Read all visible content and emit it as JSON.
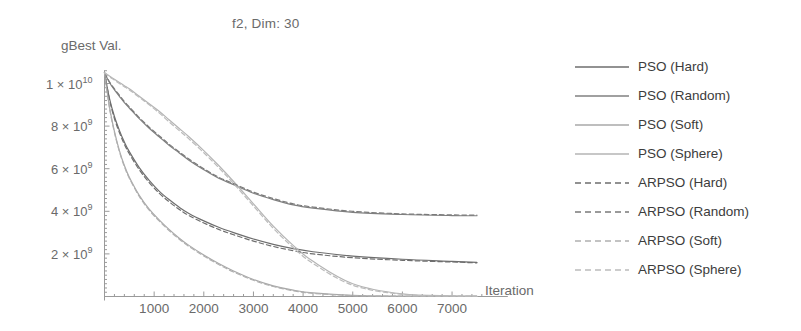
{
  "chart_data": {
    "type": "line",
    "title": "f2, Dim: 30",
    "xlabel": "Iteration",
    "ylabel": "gBest Val.",
    "xlim": [
      0,
      7600
    ],
    "ylim": [
      0,
      11000000000
    ],
    "grid": false,
    "legend_position": "right",
    "x_ticks": [
      {
        "value": 1000,
        "label": "1000"
      },
      {
        "value": 2000,
        "label": "2000"
      },
      {
        "value": 3000,
        "label": "3000"
      },
      {
        "value": 4000,
        "label": "4000"
      },
      {
        "value": 5000,
        "label": "5000"
      },
      {
        "value": 6000,
        "label": "6000"
      },
      {
        "value": 7000,
        "label": "7000"
      }
    ],
    "y_ticks": [
      {
        "value": 10000000000,
        "mantissa": "1",
        "exponent": "10",
        "label": "1 × 10^10"
      },
      {
        "value": 8000000000,
        "mantissa": "8",
        "exponent": "9",
        "label": "8 × 10^9"
      },
      {
        "value": 6000000000,
        "mantissa": "6",
        "exponent": "9",
        "label": "6 × 10^9"
      },
      {
        "value": 4000000000,
        "mantissa": "4",
        "exponent": "9",
        "label": "4 × 10^9"
      },
      {
        "value": 2000000000,
        "mantissa": "2",
        "exponent": "9",
        "label": "2 × 10^9"
      }
    ],
    "x": [
      0,
      100,
      200,
      300,
      400,
      500,
      700,
      900,
      1100,
      1300,
      1500,
      1700,
      2000,
      2300,
      2600,
      3000,
      3400,
      3800,
      4200,
      5000,
      6000,
      7000,
      7500
    ],
    "series": [
      {
        "name": "PSO (Hard)",
        "style": "solid",
        "color": "#6e6e6e",
        "values": [
          10500000000,
          9300000000,
          8450000000,
          7800000000,
          7250000000,
          6800000000,
          6050000000,
          5450000000,
          4950000000,
          4550000000,
          4200000000,
          3900000000,
          3550000000,
          3250000000,
          3000000000,
          2700000000,
          2450000000,
          2250000000,
          2100000000,
          1900000000,
          1750000000,
          1650000000,
          1600000000
        ]
      },
      {
        "name": "PSO (Random)",
        "style": "solid",
        "color": "#808080",
        "values": [
          10500000000,
          10050000000,
          9700000000,
          9400000000,
          9100000000,
          8850000000,
          8350000000,
          7900000000,
          7500000000,
          7100000000,
          6750000000,
          6400000000,
          5950000000,
          5550000000,
          5250000000,
          4850000000,
          4550000000,
          4300000000,
          4150000000,
          3950000000,
          3850000000,
          3800000000,
          3790000000
        ]
      },
      {
        "name": "PSO (Soft)",
        "style": "solid",
        "color": "#a8a8a8",
        "values": [
          10500000000,
          8900000000,
          7750000000,
          6850000000,
          6150000000,
          5600000000,
          4750000000,
          4100000000,
          3600000000,
          3150000000,
          2750000000,
          2400000000,
          1950000000,
          1550000000,
          1200000000,
          800000000,
          500000000,
          300000000,
          170000000,
          50000000,
          15000000,
          6000000,
          4000000
        ]
      },
      {
        "name": "PSO (Sphere)",
        "style": "solid",
        "color": "#b4b4b4",
        "values": [
          10500000000,
          10350000000,
          10200000000,
          10050000000,
          9900000000,
          9750000000,
          9400000000,
          9050000000,
          8700000000,
          8300000000,
          7900000000,
          7500000000,
          6850000000,
          6150000000,
          5400000000,
          4350000000,
          3300000000,
          2400000000,
          1650000000,
          600000000,
          120000000,
          30000000,
          15000000
        ]
      },
      {
        "name": "ARPSO (Hard)",
        "style": "dashed",
        "color": "#6e6e6e",
        "values": [
          10500000000,
          9250000000,
          8350000000,
          7700000000,
          7150000000,
          6700000000,
          5950000000,
          5350000000,
          4850000000,
          4450000000,
          4100000000,
          3800000000,
          3450000000,
          3150000000,
          2900000000,
          2600000000,
          2350000000,
          2150000000,
          2000000000,
          1820000000,
          1700000000,
          1620000000,
          1580000000
        ]
      },
      {
        "name": "ARPSO (Random)",
        "style": "dashed",
        "color": "#7a7a7a",
        "values": [
          10500000000,
          10080000000,
          9750000000,
          9450000000,
          9150000000,
          8900000000,
          8400000000,
          7950000000,
          7550000000,
          7150000000,
          6800000000,
          6450000000,
          6000000000,
          5600000000,
          5300000000,
          4900000000,
          4600000000,
          4350000000,
          4200000000,
          4000000000,
          3880000000,
          3830000000,
          3820000000
        ]
      },
      {
        "name": "ARPSO (Soft)",
        "style": "dashed",
        "color": "#b0b0b0",
        "values": [
          10500000000,
          8850000000,
          7700000000,
          6800000000,
          6100000000,
          5550000000,
          4700000000,
          4050000000,
          3550000000,
          3100000000,
          2700000000,
          2350000000,
          1900000000,
          1500000000,
          1150000000,
          760000000,
          470000000,
          270000000,
          150000000,
          40000000,
          12000000,
          5000000,
          3000000
        ]
      },
      {
        "name": "ARPSO (Sphere)",
        "style": "dashed",
        "color": "#bcbcbc",
        "values": [
          10500000000,
          10320000000,
          10160000000,
          10000000000,
          9850000000,
          9700000000,
          9350000000,
          9000000000,
          8620000000,
          8200000000,
          7800000000,
          7400000000,
          6750000000,
          6050000000,
          5300000000,
          4250000000,
          3200000000,
          2300000000,
          1550000000,
          530000000,
          100000000,
          25000000,
          12000000
        ]
      }
    ]
  }
}
